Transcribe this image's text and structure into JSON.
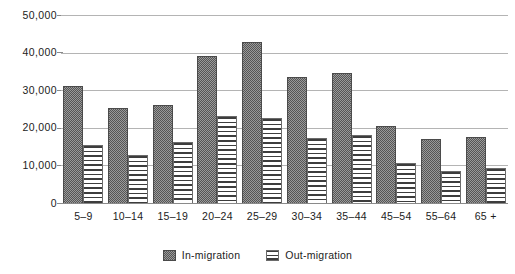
{
  "chart_data": {
    "type": "bar",
    "title": "",
    "subtitle": "",
    "xlabel": "",
    "ylabel": "",
    "ylim": [
      0,
      50000
    ],
    "yticks": [
      "0",
      "10,000",
      "20,000",
      "30,000",
      "40,000",
      "50,000"
    ],
    "ytick_values": [
      0,
      10000,
      20000,
      30000,
      40000,
      50000
    ],
    "grid": true,
    "grid_axis": "y",
    "legend_position": "bottom-center",
    "categories": [
      "5–9",
      "10–14",
      "15–19",
      "20–24",
      "25–29",
      "30–34",
      "35–44",
      "45–54",
      "55–64",
      "65 +"
    ],
    "series": [
      {
        "name": "In-migration",
        "pattern": "dark-stipple",
        "color": "#6e6e6e",
        "values": [
          31000,
          25300,
          26000,
          39000,
          42800,
          33500,
          34500,
          20500,
          16900,
          17500
        ]
      },
      {
        "name": "Out-migration",
        "pattern": "horizontal-stripes",
        "color": "#ffffff",
        "values": [
          15400,
          12700,
          16200,
          23200,
          22500,
          17200,
          18100,
          10600,
          8600,
          9300
        ]
      }
    ]
  }
}
